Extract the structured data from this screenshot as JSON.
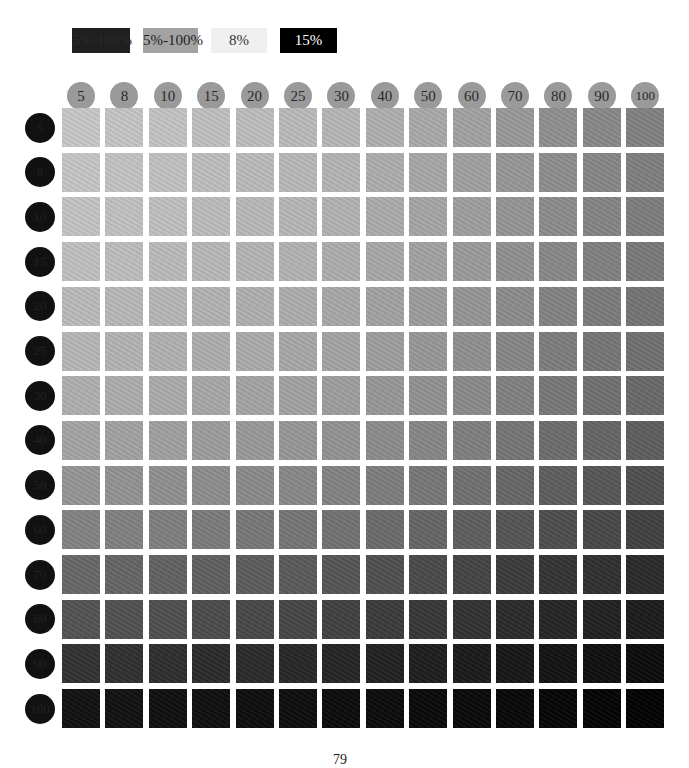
{
  "legend": [
    {
      "label": "5%-100%",
      "bg": "#1f1f1f",
      "fg": "#2a2a2a",
      "x": 72,
      "w": 58
    },
    {
      "label": "5%-100%",
      "bg": "#a3a3a3",
      "fg": "#222222",
      "x": 143,
      "w": 55
    },
    {
      "label": "8%",
      "bg": "#f0f0f0",
      "fg": "#333333",
      "x": 211,
      "w": 56
    },
    {
      "label": "15%",
      "bg": "#000000",
      "fg": "#ffffff",
      "x": 280,
      "w": 57
    }
  ],
  "page_number": "79",
  "chart_data": {
    "type": "heatmap",
    "title": "",
    "x": [
      5,
      8,
      10,
      15,
      20,
      25,
      30,
      40,
      50,
      60,
      70,
      80,
      90,
      100
    ],
    "y": [
      5,
      8,
      10,
      15,
      20,
      25,
      30,
      40,
      50,
      60,
      70,
      80,
      90,
      100
    ],
    "xlabel": "Tint % (column)",
    "ylabel": "Tint % (row)",
    "legend": [
      "5%-100%",
      "5%-100%",
      "8%",
      "15%"
    ],
    "values_gray": [
      [
        200,
        197,
        195,
        192,
        189,
        186,
        182,
        176,
        170,
        163,
        153,
        144,
        137,
        130
      ],
      [
        198,
        195,
        193,
        190,
        187,
        184,
        180,
        174,
        168,
        161,
        151,
        142,
        135,
        128
      ],
      [
        196,
        193,
        191,
        188,
        185,
        182,
        178,
        172,
        166,
        159,
        149,
        140,
        133,
        126
      ],
      [
        192,
        189,
        187,
        184,
        181,
        178,
        174,
        168,
        162,
        155,
        145,
        136,
        129,
        122
      ],
      [
        187,
        184,
        182,
        179,
        176,
        173,
        169,
        163,
        157,
        150,
        140,
        131,
        124,
        117
      ],
      [
        182,
        179,
        177,
        174,
        171,
        168,
        164,
        158,
        152,
        145,
        135,
        126,
        119,
        112
      ],
      [
        176,
        173,
        171,
        168,
        165,
        162,
        158,
        152,
        146,
        139,
        129,
        120,
        113,
        106
      ],
      [
        165,
        162,
        160,
        157,
        154,
        151,
        147,
        141,
        135,
        128,
        118,
        109,
        102,
        95
      ],
      [
        150,
        147,
        145,
        142,
        139,
        136,
        132,
        126,
        120,
        113,
        103,
        94,
        87,
        80
      ],
      [
        132,
        129,
        127,
        124,
        121,
        118,
        114,
        108,
        102,
        95,
        86,
        78,
        72,
        66
      ],
      [
        104,
        101,
        99,
        96,
        93,
        90,
        86,
        80,
        74,
        68,
        60,
        53,
        48,
        42
      ],
      [
        84,
        81,
        79,
        76,
        73,
        70,
        66,
        60,
        55,
        50,
        44,
        38,
        33,
        28
      ],
      [
        50,
        48,
        46,
        44,
        42,
        40,
        37,
        33,
        30,
        27,
        23,
        19,
        15,
        12
      ],
      [
        18,
        17,
        16,
        15,
        14,
        13,
        12,
        11,
        10,
        9,
        8,
        6,
        4,
        2
      ]
    ]
  }
}
